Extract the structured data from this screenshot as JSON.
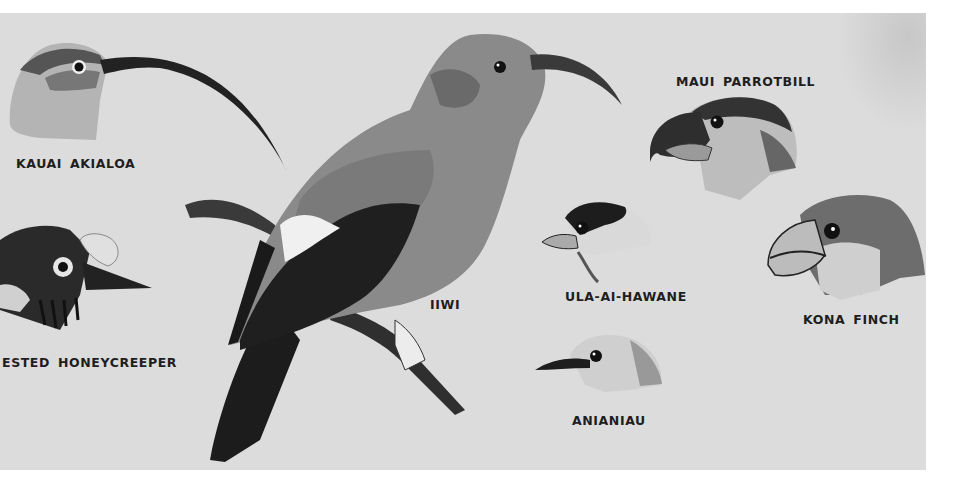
{
  "plate": {
    "background": "#dcdcdc",
    "subject": "Hawaiian honeycreepers illustration plate",
    "labels": {
      "kauai_akialoa": "KAUAI AKIALOA",
      "crested_honeycreeper": "ESTED HONEYCREEPER",
      "iiwi": "IIWI",
      "maui_parrotbill": "MAUI PARROTBILL",
      "ula_ai_hawane": "ULA-AI-HAWANE",
      "kona_finch": "KONA FINCH",
      "anianiau": "ANIANIAU"
    }
  }
}
